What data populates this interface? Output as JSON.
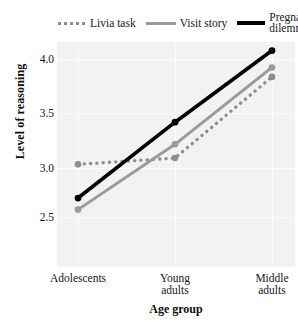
{
  "chart_data": {
    "type": "line",
    "title": "",
    "xlabel": "Age group",
    "ylabel": "Level of reasoning",
    "categories": [
      "Adolescents",
      "Young\nadults",
      "Middle\nadults"
    ],
    "category_labels": [
      {
        "line1": "Adolescents",
        "line2": ""
      },
      {
        "line1": "Young",
        "line2": "adults"
      },
      {
        "line1": "Middle",
        "line2": "adults"
      }
    ],
    "ylim": [
      2.35,
      4.2
    ],
    "yticks": [
      "2.5",
      "3.0",
      "3.5",
      "4.0"
    ],
    "ytick_values": [
      2.5,
      3.0,
      3.5,
      4.0
    ],
    "grid": true,
    "legend_position": "top",
    "series": [
      {
        "name": "Livia task",
        "style": "dotted",
        "color": "#8d8d8d",
        "values": [
          3.0,
          3.06,
          3.83
        ]
      },
      {
        "name": "Visit story",
        "style": "solid",
        "color": "#9a9a9a",
        "values": [
          2.57,
          3.19,
          3.92
        ]
      },
      {
        "name": "Pregnancy dilemma",
        "style": "solid-bold",
        "color": "#000000",
        "values": [
          2.68,
          3.4,
          4.08
        ]
      }
    ]
  },
  "legend": {
    "items": [
      {
        "label": "Livia task",
        "swatch": "dotted-gray-line-icon"
      },
      {
        "label": "Visit story",
        "swatch": "solid-gray-line-icon"
      },
      {
        "label": "Pregnancy dilemma",
        "swatch": "solid-black-line-icon"
      }
    ]
  },
  "axes": {
    "y": {
      "label": "Level of reasoning",
      "ticks": [
        "4.0",
        "3.5",
        "3.0",
        "2.5"
      ]
    },
    "x": {
      "label": "Age group",
      "ticks": [
        "Adolescents",
        "Young adults",
        "Middle adults"
      ]
    }
  },
  "colors": {
    "plot_background": "#f2f2f2",
    "gridline": "#fbfbfb",
    "series_livia": "#8d8d8d",
    "series_visit": "#9a9a9a",
    "series_pregnancy": "#000000",
    "text": "#161616"
  }
}
